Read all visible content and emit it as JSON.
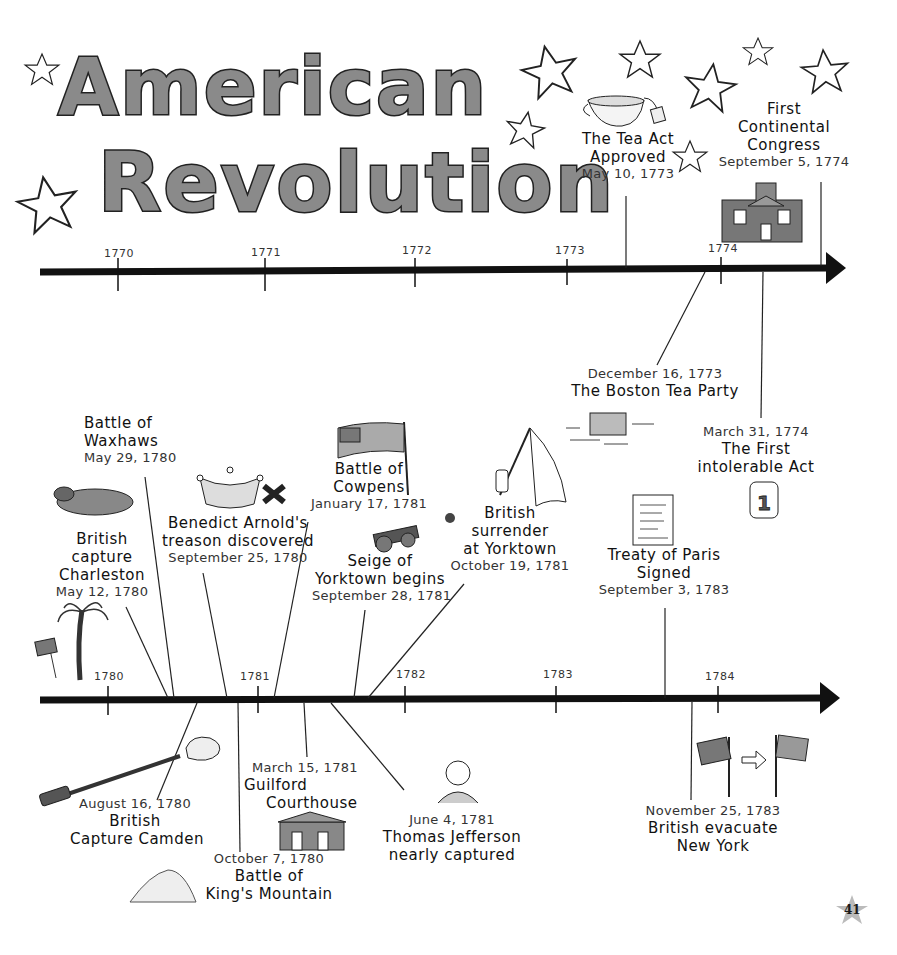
{
  "title": {
    "line1": "American",
    "line2": "Revolution"
  },
  "timelines": [
    {
      "id": "top",
      "axis_y": 270,
      "years": [
        {
          "label": "1770",
          "x": 118
        },
        {
          "label": "1771",
          "x": 265
        },
        {
          "label": "1772",
          "x": 415
        },
        {
          "label": "1773",
          "x": 567
        },
        {
          "label": "1774",
          "x": 721
        }
      ],
      "events": [
        {
          "name_lines": [
            "The Tea Act",
            "Approved"
          ],
          "date": "May 10, 1773",
          "illustration": "teacup-icon"
        },
        {
          "name_lines": [
            "First",
            "Continental",
            "Congress"
          ],
          "date": "September 5, 1774",
          "illustration": "building-icon"
        },
        {
          "name_lines": [
            "The Boston Tea Party"
          ],
          "date": "December 16, 1773",
          "illustration": "tea-crate-icon"
        },
        {
          "name_lines": [
            "The First",
            "intolerable Act"
          ],
          "date": "March 31, 1774",
          "illustration": "scroll-icon",
          "scroll_label": "1"
        }
      ]
    },
    {
      "id": "bottom",
      "axis_y": 700,
      "years": [
        {
          "label": "1780",
          "x": 108
        },
        {
          "label": "1781",
          "x": 258
        },
        {
          "label": "1782",
          "x": 405
        },
        {
          "label": "1783",
          "x": 556
        },
        {
          "label": "1784",
          "x": 718
        }
      ],
      "events": [
        {
          "name_lines": [
            "Battle of",
            "Waxhaws"
          ],
          "date": "May 29, 1780",
          "illustration": "horse-icon"
        },
        {
          "name_lines": [
            "British",
            "capture",
            "Charleston"
          ],
          "date": "May 12, 1780",
          "illustration": "palm-tree-flag-icon"
        },
        {
          "name_lines": [
            "Benedict Arnold's",
            "treason discovered"
          ],
          "date": "September 25, 1780",
          "illustration": "crown-cross-icon"
        },
        {
          "name_lines": [
            "Battle of",
            "Cowpens"
          ],
          "date": "January 17, 1781",
          "illustration": "american-flag-icon"
        },
        {
          "name_lines": [
            "Seige of",
            "Yorktown begins"
          ],
          "date": "September 28, 1781",
          "illustration": "cannon-icon"
        },
        {
          "name_lines": [
            "British",
            "surrender",
            "at Yorktown"
          ],
          "date": "October 19, 1781",
          "illustration": "white-flag-icon"
        },
        {
          "name_lines": [
            "Treaty of Paris",
            "Signed"
          ],
          "date": "September 3, 1783",
          "illustration": "treaty-document-icon"
        },
        {
          "name_lines": [
            "British",
            "Capture Camden"
          ],
          "date": "August 16, 1780",
          "illustration": "musket-icon"
        },
        {
          "name_lines": [
            "Guilford",
            "Courthouse"
          ],
          "date": "March 15, 1781",
          "illustration": "courthouse-icon"
        },
        {
          "name_lines": [
            "Battle of",
            "King's Mountain"
          ],
          "date": "October 7, 1780",
          "illustration": "mountain-icon"
        },
        {
          "name_lines": [
            "Thomas Jefferson",
            "nearly captured"
          ],
          "date": "June 4, 1781",
          "illustration": "jefferson-portrait-icon"
        },
        {
          "name_lines": [
            "British evacuate",
            "New York"
          ],
          "date": "November 25, 1783",
          "illustration": "flags-exchange-icon"
        }
      ]
    }
  ],
  "page_number": "41",
  "colors": {
    "ink": "#111111",
    "title_fill": "#8a8a8a",
    "background": "#ffffff"
  }
}
